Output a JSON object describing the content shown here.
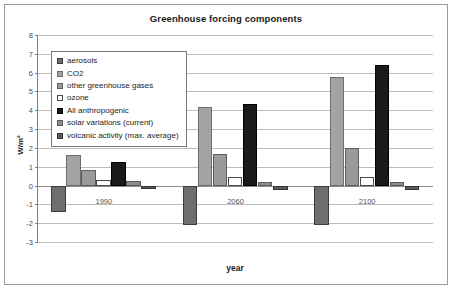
{
  "chart_data": {
    "type": "bar",
    "title": "Greenhouse forcing components",
    "xlabel": "year",
    "ylabel": "W/m²",
    "categories": [
      "1990",
      "2060",
      "2100"
    ],
    "ylim": [
      -3,
      8
    ],
    "yticks": [
      8,
      7,
      6,
      5,
      4,
      3,
      2,
      1,
      0,
      -1,
      -2,
      -3
    ],
    "ytick_labels": [
      "8",
      "7",
      "6",
      "5",
      "4",
      "3",
      "2",
      "1",
      "0",
      "-1",
      "-2",
      "-3"
    ],
    "grid": true,
    "legend_position": "upper-left-inside",
    "series": [
      {
        "name": "aerosols",
        "color": "#6e6e6e",
        "border": "#3d3d3d",
        "values": [
          -1.4,
          -2.1,
          -2.1
        ]
      },
      {
        "name": "CO2",
        "color": "#a3a3a3",
        "border": "#6d6d6d",
        "values": [
          1.6,
          4.15,
          5.75
        ]
      },
      {
        "name": "other greenhouse gases",
        "color": "#9a9a9a",
        "border": "#5e5e5e",
        "values": [
          0.8,
          1.65,
          2.0
        ]
      },
      {
        "name": "ozone",
        "color": "#ffffff",
        "border": "#4a4a4a",
        "values": [
          0.3,
          0.45,
          0.45
        ]
      },
      {
        "name": "All anthropogenic",
        "color": "#1a1a1a",
        "border": "#000000",
        "values": [
          1.25,
          4.35,
          6.4
        ]
      },
      {
        "name": "solar variations (current)",
        "color": "#8c8c8c",
        "border": "#5a5a5a",
        "values": [
          0.25,
          0.2,
          0.18
        ]
      },
      {
        "name": "volcanic activity (max. average)",
        "color": "#5d5d5d",
        "border": "#333333",
        "values": [
          -0.2,
          -0.25,
          -0.25
        ]
      }
    ]
  },
  "legend": {
    "items": [
      {
        "label": "aerosols"
      },
      {
        "label": "CO2"
      },
      {
        "label": "other greenhouse gases"
      },
      {
        "label": "ozone"
      },
      {
        "label": "All anthropogenic"
      },
      {
        "label": "solar variations (current)"
      },
      {
        "label": "volcanic activity (max. average)"
      }
    ]
  }
}
